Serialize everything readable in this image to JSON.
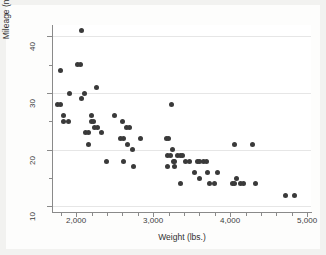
{
  "figure": {
    "background_color": "#f2f2f0",
    "paper_color": "#fdfdfc",
    "plot_background_color": "#ffffff",
    "marker_color": "#3a3a3a",
    "grid_color": "#e6e6e6",
    "axis_color": "#8a8a8a"
  },
  "chart_data": {
    "type": "scatter",
    "title": "",
    "xlabel": "Weight (lbs.)",
    "ylabel": "Mileage (mpg)",
    "xlim": [
      1700,
      5050
    ],
    "ylim": [
      9,
      42
    ],
    "xticks": [
      2000,
      3000,
      4000,
      5000
    ],
    "xticklabels": [
      "2,000",
      "3,000",
      "4,000",
      "5,000"
    ],
    "xminorticks": [
      1800,
      2200,
      2400,
      2600,
      2800,
      3200,
      3400,
      3600,
      3800,
      4200,
      4400,
      4600,
      4800
    ],
    "yticks": [
      10,
      20,
      30,
      40
    ],
    "yticklabels": [
      "10",
      "20",
      "30",
      "40"
    ],
    "yminorticks": [
      15,
      25,
      35
    ],
    "grid": "horizontal-major",
    "legend": "none",
    "marker": "circle",
    "marker_size": 5,
    "series": [
      {
        "name": "Automobiles",
        "points": [
          [
            1800,
            34
          ],
          [
            1760,
            28
          ],
          [
            1800,
            28
          ],
          [
            1830,
            26
          ],
          [
            1830,
            25
          ],
          [
            1900,
            25
          ],
          [
            1920,
            30
          ],
          [
            2020,
            35
          ],
          [
            2050,
            35
          ],
          [
            2070,
            41
          ],
          [
            2070,
            29
          ],
          [
            2110,
            30
          ],
          [
            2120,
            23
          ],
          [
            2160,
            23
          ],
          [
            2160,
            21
          ],
          [
            2200,
            26
          ],
          [
            2200,
            25
          ],
          [
            2230,
            25
          ],
          [
            2240,
            24
          ],
          [
            2260,
            31
          ],
          [
            2280,
            24
          ],
          [
            2330,
            23
          ],
          [
            2390,
            18
          ],
          [
            2500,
            26
          ],
          [
            2580,
            22
          ],
          [
            2620,
            22
          ],
          [
            2600,
            25
          ],
          [
            2620,
            18
          ],
          [
            2650,
            24
          ],
          [
            2690,
            24
          ],
          [
            2670,
            21
          ],
          [
            2730,
            20
          ],
          [
            2750,
            17
          ],
          [
            2830,
            22
          ],
          [
            3170,
            22
          ],
          [
            3200,
            22
          ],
          [
            3180,
            17
          ],
          [
            3190,
            19
          ],
          [
            3220,
            19
          ],
          [
            3240,
            28
          ],
          [
            3250,
            20
          ],
          [
            3260,
            18
          ],
          [
            3280,
            18
          ],
          [
            3280,
            17
          ],
          [
            3310,
            19
          ],
          [
            3350,
            19
          ],
          [
            3380,
            19
          ],
          [
            3360,
            14
          ],
          [
            3420,
            18
          ],
          [
            3470,
            18
          ],
          [
            3540,
            16
          ],
          [
            3570,
            18
          ],
          [
            3600,
            18
          ],
          [
            3600,
            15
          ],
          [
            3660,
            18
          ],
          [
            3690,
            18
          ],
          [
            3700,
            16
          ],
          [
            3730,
            14
          ],
          [
            3790,
            14
          ],
          [
            3830,
            16
          ],
          [
            4030,
            14
          ],
          [
            4060,
            14
          ],
          [
            4060,
            21
          ],
          [
            4080,
            15
          ],
          [
            4130,
            14
          ],
          [
            4170,
            14
          ],
          [
            4290,
            21
          ],
          [
            4330,
            14
          ],
          [
            4720,
            12
          ],
          [
            4840,
            12
          ]
        ]
      }
    ]
  }
}
